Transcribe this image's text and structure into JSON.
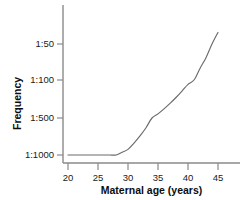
{
  "chart_data": {
    "type": "line",
    "title": "",
    "xlabel": "Maternal age (years)",
    "ylabel": "Frequency",
    "x": [
      20,
      21,
      22,
      23,
      24,
      25,
      26,
      27,
      28,
      29,
      30,
      31,
      32,
      33,
      34,
      35,
      36,
      37,
      38,
      39,
      40,
      41,
      42,
      43,
      44,
      45
    ],
    "xlim": [
      20,
      45
    ],
    "xticks": [
      20,
      25,
      30,
      35,
      40,
      45
    ],
    "xticklabels": [
      "20",
      "25",
      "30",
      "35",
      "40",
      "45"
    ],
    "yticks": [
      "1:1000",
      "1:500",
      "1:100",
      "1:50"
    ],
    "yticklabels": [
      "1:50",
      "1:100",
      "1:500",
      "1:1000"
    ],
    "ytick_values": [
      1000,
      500,
      100,
      50
    ],
    "ylabel_order_top_to_bottom": [
      "1:50",
      "1:100",
      "1:500",
      "1:1000"
    ],
    "grid": false,
    "legend": false,
    "series": [
      {
        "name": "Frequency of chromosomal abnormality",
        "color": "#6b6b6b",
        "values": [
          "1:1000",
          "1:1000",
          "1:1000",
          "1:1000",
          "1:1000",
          "1:1000",
          "1:1000",
          "1:1000",
          "1:1000",
          "1:950",
          "1:900",
          "1:800",
          "1:700",
          "1:600",
          "1:500",
          "1:420",
          "1:340",
          "1:270",
          "1:210",
          "1:160",
          "1:120",
          "1:100",
          "1:80",
          "1:65",
          "1:50",
          "1:40"
        ]
      }
    ]
  },
  "axes": {
    "y_axis_label": "Frequency",
    "x_axis_label": "Maternal age (years)",
    "y_tick_labels": [
      "1:50",
      "1:100",
      "1:500",
      "1:1000"
    ],
    "x_tick_labels": [
      "20",
      "25",
      "30",
      "35",
      "40",
      "45"
    ]
  },
  "colors": {
    "curve": "#6b6b6b",
    "axis": "#8a8a8a",
    "text": "#1a1a1a",
    "background": "#ffffff"
  }
}
